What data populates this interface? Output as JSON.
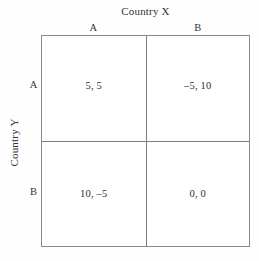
{
  "figure": {
    "type": "payoff-matrix",
    "column_axis_title": "Country X",
    "row_axis_title": "Country Y",
    "column_headers": [
      "A",
      "B"
    ],
    "row_headers": [
      "A",
      "B"
    ],
    "cells": [
      [
        "5, 5",
        "–5, 10"
      ],
      [
        "10, –5",
        "0, 0"
      ]
    ],
    "colors": {
      "border": "#8a8a8a",
      "inner_border": "#7d7d7d",
      "text": "#2e2e2e",
      "background": "#ffffff"
    }
  },
  "chart_data": {
    "type": "table",
    "title": "Country X",
    "xlabel": "Country X",
    "ylabel": "Country Y",
    "columns": [
      "A",
      "B"
    ],
    "rows": [
      "A",
      "B"
    ],
    "cell_text": [
      [
        "5, 5",
        "–5, 10"
      ],
      [
        "10, –5",
        "0, 0"
      ]
    ],
    "payoffs": [
      [
        {
          "row_player": 5,
          "column_player": 5
        },
        {
          "row_player": -5,
          "column_player": 10
        }
      ],
      [
        {
          "row_player": 10,
          "column_player": -5
        },
        {
          "row_player": 0,
          "column_player": 0
        }
      ]
    ],
    "grid": true,
    "legend": "none"
  }
}
